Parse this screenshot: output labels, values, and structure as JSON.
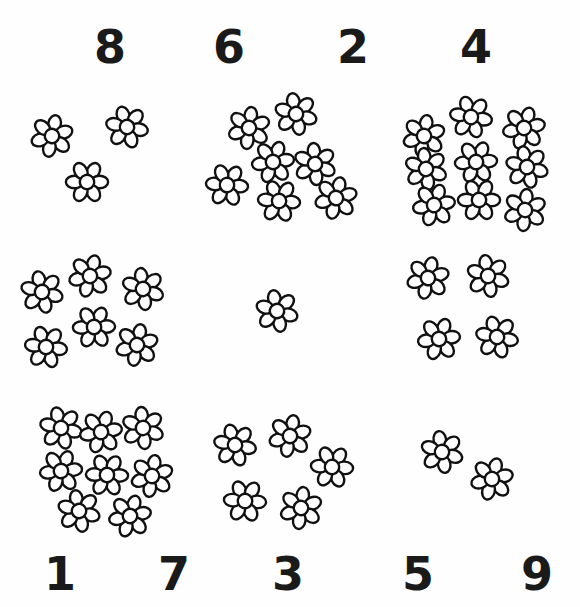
{
  "worksheet": {
    "title": "Count the flowers worksheet",
    "background_color": "#fefefe",
    "ink_color": "#111111",
    "numeral_color": "#1a1a1a"
  },
  "top_numerals": [
    {
      "label": "8",
      "x": 94,
      "y": 24
    },
    {
      "label": "6",
      "x": 213,
      "y": 24
    },
    {
      "label": "2",
      "x": 337,
      "y": 24
    },
    {
      "label": "4",
      "x": 460,
      "y": 24
    }
  ],
  "bottom_numerals": [
    {
      "label": "1",
      "x": 44,
      "y": 551
    },
    {
      "label": "7",
      "x": 158,
      "y": 551
    },
    {
      "label": "3",
      "x": 272,
      "y": 551
    },
    {
      "label": "5",
      "x": 402,
      "y": 551
    },
    {
      "label": "9",
      "x": 521,
      "y": 551
    }
  ],
  "flower_groups": [
    {
      "name": "group-row1-col1",
      "count": 3,
      "flowers": [
        {
          "x": 28,
          "y": 112,
          "rot": 12
        },
        {
          "x": 103,
          "y": 103,
          "rot": -18
        },
        {
          "x": 63,
          "y": 158,
          "rot": 30
        }
      ]
    },
    {
      "name": "group-row1-col2",
      "count": 7,
      "flowers": [
        {
          "x": 225,
          "y": 104,
          "rot": 8
        },
        {
          "x": 272,
          "y": 90,
          "rot": -12
        },
        {
          "x": 249,
          "y": 138,
          "rot": 22
        },
        {
          "x": 291,
          "y": 140,
          "rot": -5
        },
        {
          "x": 203,
          "y": 161,
          "rot": 35
        },
        {
          "x": 255,
          "y": 177,
          "rot": -25
        },
        {
          "x": 312,
          "y": 174,
          "rot": 14
        }
      ]
    },
    {
      "name": "group-row1-col3",
      "count": 9,
      "flowers": [
        {
          "x": 400,
          "y": 112,
          "rot": 10
        },
        {
          "x": 447,
          "y": 93,
          "rot": -20
        },
        {
          "x": 500,
          "y": 104,
          "rot": 18
        },
        {
          "x": 402,
          "y": 145,
          "rot": -8
        },
        {
          "x": 452,
          "y": 138,
          "rot": 26
        },
        {
          "x": 503,
          "y": 143,
          "rot": -14
        },
        {
          "x": 410,
          "y": 181,
          "rot": 20
        },
        {
          "x": 455,
          "y": 176,
          "rot": -30
        },
        {
          "x": 501,
          "y": 186,
          "rot": 6
        }
      ]
    },
    {
      "name": "group-row2-col1",
      "count": 6,
      "flowers": [
        {
          "x": 18,
          "y": 268,
          "rot": -14
        },
        {
          "x": 66,
          "y": 252,
          "rot": 16
        },
        {
          "x": 119,
          "y": 265,
          "rot": -8
        },
        {
          "x": 70,
          "y": 303,
          "rot": 28
        },
        {
          "x": 22,
          "y": 323,
          "rot": -22
        },
        {
          "x": 113,
          "y": 321,
          "rot": 12
        }
      ]
    },
    {
      "name": "group-row2-col2",
      "count": 1,
      "flowers": [
        {
          "x": 253,
          "y": 287,
          "rot": -12
        }
      ]
    },
    {
      "name": "group-row2-col3",
      "count": 4,
      "flowers": [
        {
          "x": 404,
          "y": 254,
          "rot": 14
        },
        {
          "x": 464,
          "y": 252,
          "rot": -10
        },
        {
          "x": 415,
          "y": 315,
          "rot": 22
        },
        {
          "x": 473,
          "y": 313,
          "rot": -18
        }
      ]
    },
    {
      "name": "group-row3-col1",
      "count": 8,
      "flowers": [
        {
          "x": 37,
          "y": 404,
          "rot": -16
        },
        {
          "x": 77,
          "y": 408,
          "rot": 20
        },
        {
          "x": 119,
          "y": 404,
          "rot": -6
        },
        {
          "x": 37,
          "y": 447,
          "rot": 24
        },
        {
          "x": 83,
          "y": 451,
          "rot": -28
        },
        {
          "x": 128,
          "y": 452,
          "rot": 10
        },
        {
          "x": 55,
          "y": 487,
          "rot": -12
        },
        {
          "x": 106,
          "y": 492,
          "rot": 18
        }
      ]
    },
    {
      "name": "group-row3-col2",
      "count": 5,
      "flowers": [
        {
          "x": 211,
          "y": 421,
          "rot": -18
        },
        {
          "x": 266,
          "y": 412,
          "rot": 12
        },
        {
          "x": 308,
          "y": 443,
          "rot": 34
        },
        {
          "x": 221,
          "y": 477,
          "rot": -26
        },
        {
          "x": 277,
          "y": 484,
          "rot": 8
        }
      ]
    },
    {
      "name": "group-row3-col3",
      "count": 2,
      "flowers": [
        {
          "x": 418,
          "y": 428,
          "rot": -10
        },
        {
          "x": 468,
          "y": 455,
          "rot": 16
        }
      ]
    }
  ]
}
